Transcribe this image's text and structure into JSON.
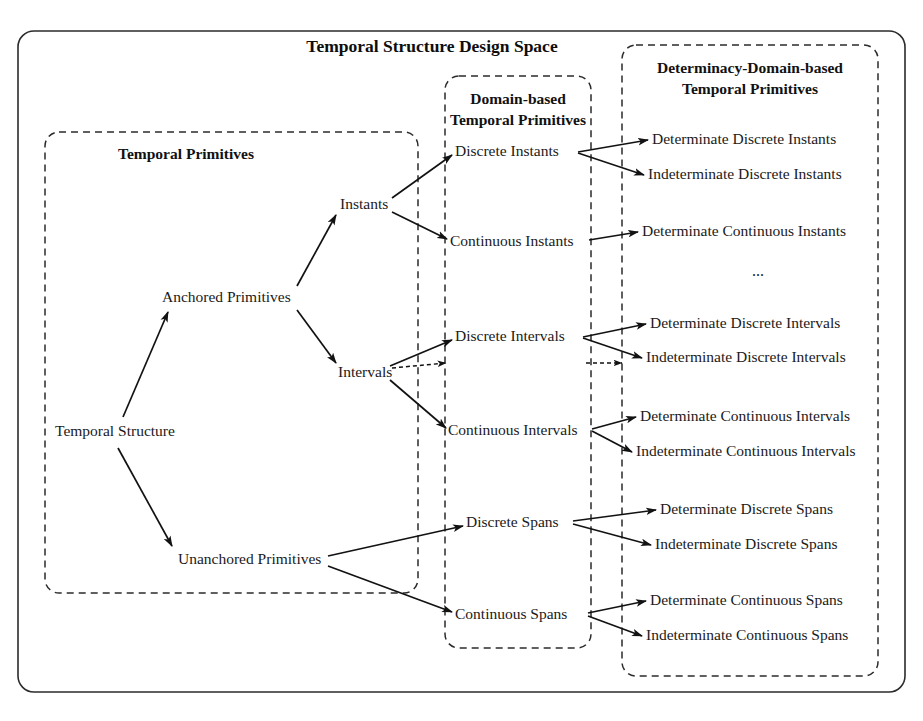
{
  "diagram": {
    "title": "Temporal Structure Design Space",
    "type": "tree-taxonomy-diagram",
    "panels": [
      {
        "id": "temporal-primitives",
        "title_lines": [
          "Temporal Primitives"
        ],
        "x": 45,
        "y": 132,
        "w": 373,
        "h": 461
      },
      {
        "id": "domain-based-temporal-primitives",
        "title_lines": [
          "Domain-based",
          "Temporal Primitives"
        ],
        "x": 445,
        "y": 76,
        "w": 146,
        "h": 572
      },
      {
        "id": "determinacy-domain-based-temporal-primitives",
        "title_lines": [
          "Determinacy-Domain-based",
          "Temporal Primitives"
        ],
        "x": 622,
        "y": 45,
        "w": 256,
        "h": 631
      }
    ],
    "nodes": [
      {
        "id": "temporal-structure",
        "label": "Temporal Structure",
        "x": 55,
        "y": 432,
        "anchor": "start"
      },
      {
        "id": "anchored-primitives",
        "label": "Anchored Primitives",
        "x": 162,
        "y": 298,
        "anchor": "start"
      },
      {
        "id": "unanchored-primitives",
        "label": "Unanchored Primitives",
        "x": 178,
        "y": 560,
        "anchor": "start"
      },
      {
        "id": "instants",
        "label": "Instants",
        "x": 340,
        "y": 205,
        "anchor": "start"
      },
      {
        "id": "intervals",
        "label": "Intervals",
        "x": 338,
        "y": 373,
        "anchor": "start"
      },
      {
        "id": "discrete-instants",
        "label": "Discrete Instants",
        "x": 455,
        "y": 152,
        "anchor": "start"
      },
      {
        "id": "continuous-instants",
        "label": "Continuous Instants",
        "x": 450,
        "y": 242,
        "anchor": "start"
      },
      {
        "id": "discrete-intervals",
        "label": "Discrete Intervals",
        "x": 455,
        "y": 337,
        "anchor": "start"
      },
      {
        "id": "continuous-intervals",
        "label": "Continuous Intervals",
        "x": 448,
        "y": 431,
        "anchor": "start"
      },
      {
        "id": "discrete-spans",
        "label": "Discrete Spans",
        "x": 466,
        "y": 523,
        "anchor": "start"
      },
      {
        "id": "continuous-spans",
        "label": "Continuous Spans",
        "x": 455,
        "y": 615,
        "anchor": "start"
      },
      {
        "id": "determinate-discrete-instants",
        "label": "Determinate Discrete Instants",
        "x": 652,
        "y": 140,
        "anchor": "start"
      },
      {
        "id": "indeterminate-discrete-instants",
        "label": "Indeterminate Discrete Instants",
        "x": 648,
        "y": 175,
        "anchor": "start"
      },
      {
        "id": "determinate-continuous-instants",
        "label": "Determinate Continuous Instants",
        "x": 642,
        "y": 232,
        "anchor": "start"
      },
      {
        "id": "ellipsis",
        "label": "...",
        "x": 758,
        "y": 272,
        "anchor": "middle"
      },
      {
        "id": "determinate-discrete-intervals",
        "label": "Determinate Discrete Intervals",
        "x": 650,
        "y": 324,
        "anchor": "start"
      },
      {
        "id": "indeterminate-discrete-intervals",
        "label": "Indeterminate Discrete Intervals",
        "x": 646,
        "y": 358,
        "anchor": "start"
      },
      {
        "id": "determinate-continuous-intervals",
        "label": "Determinate Continuous Intervals",
        "x": 640,
        "y": 417,
        "anchor": "start"
      },
      {
        "id": "indeterminate-continuous-intervals",
        "label": "Indeterminate Continuous Intervals",
        "x": 636,
        "y": 452,
        "anchor": "start"
      },
      {
        "id": "determinate-discrete-spans",
        "label": "Determinate Discrete Spans",
        "x": 660,
        "y": 510,
        "anchor": "start"
      },
      {
        "id": "indeterminate-discrete-spans",
        "label": "Indeterminate Discrete Spans",
        "x": 655,
        "y": 545,
        "anchor": "start"
      },
      {
        "id": "determinate-continuous-spans",
        "label": "Determinate Continuous Spans",
        "x": 650,
        "y": 601,
        "anchor": "start"
      },
      {
        "id": "indeterminate-continuous-spans",
        "label": "Indeterminate Continuous Spans",
        "x": 646,
        "y": 636,
        "anchor": "start"
      }
    ],
    "edges": [
      {
        "from": "temporal-structure",
        "to": "anchored-primitives",
        "style": "solid"
      },
      {
        "from": "temporal-structure",
        "to": "unanchored-primitives",
        "style": "solid"
      },
      {
        "from": "anchored-primitives",
        "to": "instants",
        "style": "solid"
      },
      {
        "from": "anchored-primitives",
        "to": "intervals",
        "style": "solid"
      },
      {
        "from": "instants",
        "to": "discrete-instants",
        "style": "solid"
      },
      {
        "from": "instants",
        "to": "continuous-instants",
        "style": "solid"
      },
      {
        "from": "intervals",
        "to": "discrete-intervals",
        "style": "solid"
      },
      {
        "from": "intervals",
        "to": "continuous-intervals",
        "style": "solid"
      },
      {
        "from": "intervals",
        "to": "domain-boundary",
        "style": "dashed"
      },
      {
        "from": "unanchored-primitives",
        "to": "discrete-spans",
        "style": "solid"
      },
      {
        "from": "unanchored-primitives",
        "to": "continuous-spans",
        "style": "solid"
      },
      {
        "from": "discrete-instants",
        "to": "determinate-discrete-instants",
        "style": "solid"
      },
      {
        "from": "discrete-instants",
        "to": "indeterminate-discrete-instants",
        "style": "solid"
      },
      {
        "from": "continuous-instants",
        "to": "determinate-continuous-instants",
        "style": "solid"
      },
      {
        "from": "discrete-intervals",
        "to": "determinate-discrete-intervals",
        "style": "solid"
      },
      {
        "from": "discrete-intervals",
        "to": "indeterminate-discrete-intervals",
        "style": "solid"
      },
      {
        "from": "discrete-intervals",
        "to": "determinacy-boundary",
        "style": "dashed"
      },
      {
        "from": "continuous-intervals",
        "to": "determinate-continuous-intervals",
        "style": "solid"
      },
      {
        "from": "continuous-intervals",
        "to": "indeterminate-continuous-intervals",
        "style": "solid"
      },
      {
        "from": "discrete-spans",
        "to": "determinate-discrete-spans",
        "style": "solid"
      },
      {
        "from": "discrete-spans",
        "to": "indeterminate-discrete-spans",
        "style": "solid"
      },
      {
        "from": "continuous-spans",
        "to": "determinate-continuous-spans",
        "style": "solid"
      },
      {
        "from": "continuous-spans",
        "to": "indeterminate-continuous-spans",
        "style": "solid"
      }
    ],
    "colors": {
      "background": "#ffffff",
      "stroke": "#2b2b2b",
      "edge": "#121212",
      "text": "#1a1a1a"
    }
  }
}
